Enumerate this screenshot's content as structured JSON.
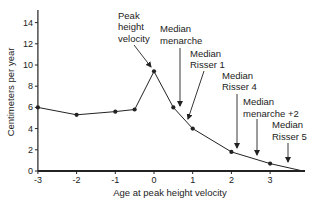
{
  "chart_data": {
    "type": "line",
    "title": "",
    "xlabel": "Age at peak height velocity",
    "ylabel": "Centimeters per year",
    "xlim": [
      -3,
      3.85
    ],
    "ylim": [
      0,
      15
    ],
    "x_ticks": [
      -3,
      -2,
      -1,
      0,
      1,
      2,
      3
    ],
    "y_ticks": [
      0,
      2,
      4,
      6,
      8,
      10,
      12,
      14
    ],
    "grid": false,
    "legend": null,
    "series": [
      {
        "name": "Height velocity",
        "x": [
          -3,
          -2,
          -1,
          -0.5,
          0,
          0.5,
          1,
          2,
          3,
          3.85
        ],
        "y": [
          6.0,
          5.3,
          5.6,
          5.8,
          9.4,
          6.0,
          4.0,
          1.8,
          0.7,
          0
        ],
        "markers": [
          true,
          true,
          true,
          true,
          true,
          true,
          true,
          true,
          true,
          false
        ]
      }
    ],
    "annotations": [
      {
        "lines": [
          "Peak",
          "height",
          "velocity"
        ],
        "target_x": 0,
        "text_pos": [
          118,
          18.5
        ],
        "arrow": [
          [
            134,
            45
          ],
          [
            151,
            67
          ]
        ]
      },
      {
        "lines": [
          "Median",
          "menarche"
        ],
        "target_x": 0.67,
        "text_pos": [
          160,
          32
        ],
        "arrow": [
          [
            180,
            48
          ],
          [
            180,
            106
          ]
        ]
      },
      {
        "lines": [
          "Median",
          "Risser 1"
        ],
        "target_x": 0.88,
        "text_pos": [
          190,
          56.5
        ],
        "arrow": [
          [
            204,
            71
          ],
          [
            188,
            119
          ]
        ]
      },
      {
        "lines": [
          "Median",
          "Risser 4"
        ],
        "target_x": 2.15,
        "text_pos": [
          222,
          78.5
        ],
        "arrow": [
          [
            237,
            94
          ],
          [
            237,
            148
          ]
        ]
      },
      {
        "lines": [
          "Median",
          "menarche +2"
        ],
        "target_x": 2.65,
        "text_pos": [
          243,
          105
        ],
        "arrow": [
          [
            257,
            119
          ],
          [
            257,
            155
          ]
        ]
      },
      {
        "lines": [
          "Median",
          "Risser 5"
        ],
        "target_x": 3.45,
        "text_pos": [
          272,
          128
        ],
        "arrow": [
          [
            288,
            143
          ],
          [
            288,
            162
          ]
        ]
      }
    ]
  },
  "colors": {
    "ink": "#222222",
    "background": "#ffffff"
  }
}
